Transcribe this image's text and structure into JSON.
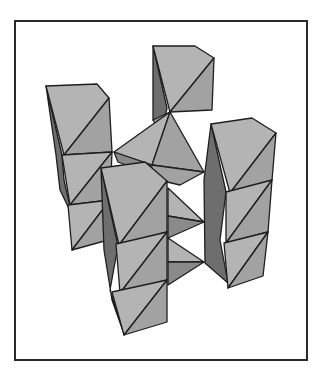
{
  "figure": {
    "frame": {
      "x": 14,
      "y": 20,
      "width": 290,
      "height": 337,
      "border_color": "#2a2a2a"
    },
    "colors": {
      "light": "#b4b4b4",
      "mid": "#a2a2a2",
      "dark": "#8a8a8a",
      "darker": "#6e6e6e",
      "edge": "#1e1e1e",
      "background": "#ffffff"
    },
    "polyhedra": [
      {
        "name": "back-center-octahedra-chain",
        "faces": [
          {
            "shade": "darker",
            "pts": "153,46 167,108 163,126 153,120"
          },
          {
            "shade": "light",
            "pts": "153,46 195,46 214,58 170,112"
          },
          {
            "shade": "mid",
            "pts": "214,58 212,110 170,112"
          },
          {
            "shade": "mid",
            "pts": "153,120 170,112 165,140"
          }
        ]
      },
      {
        "name": "left-octahedra-chain",
        "faces": [
          {
            "shade": "darker",
            "pts": "46,86 62,155 64,180 72,215 60,190 56,155"
          },
          {
            "shade": "light",
            "pts": "46,86 97,84 109,98 64,155"
          },
          {
            "shade": "mid",
            "pts": "109,98 112,152 64,155"
          },
          {
            "shade": "light",
            "pts": "62,155 112,152 70,205"
          },
          {
            "shade": "mid",
            "pts": "112,152 110,200 70,205"
          },
          {
            "shade": "light",
            "pts": "68,205 110,200 72,250"
          },
          {
            "shade": "mid",
            "pts": "110,200 108,240 72,250"
          }
        ]
      },
      {
        "name": "central-tetrahedra-stack",
        "faces": [
          {
            "shade": "light",
            "pts": "114,152 170,112 152,165"
          },
          {
            "shade": "mid",
            "pts": "170,112 204,172 152,165"
          },
          {
            "shade": "dark",
            "pts": "114,152 152,165 140,170 118,162"
          },
          {
            "shade": "mid",
            "pts": "152,165 204,172 180,185 150,178"
          },
          {
            "shade": "light",
            "pts": "168,188 204,222 168,216"
          },
          {
            "shade": "dark",
            "pts": "168,216 204,222 168,238"
          },
          {
            "shade": "light",
            "pts": "168,238 204,262 168,262"
          },
          {
            "shade": "dark",
            "pts": "168,262 204,262 168,285"
          }
        ]
      },
      {
        "name": "right-octahedra-chain",
        "faces": [
          {
            "shade": "darker",
            "pts": "211,124 226,192 220,240 228,283 205,263 204,180"
          },
          {
            "shade": "light",
            "pts": "211,124 252,118 276,133 230,193"
          },
          {
            "shade": "mid",
            "pts": "276,133 272,180 230,193"
          },
          {
            "shade": "light",
            "pts": "226,192 272,180 226,243"
          },
          {
            "shade": "mid",
            "pts": "272,180 268,232 226,243"
          },
          {
            "shade": "light",
            "pts": "224,243 268,232 228,288"
          },
          {
            "shade": "mid",
            "pts": "268,232 263,276 228,288"
          }
        ]
      },
      {
        "name": "front-center-octahedra-chain",
        "faces": [
          {
            "shade": "darker",
            "pts": "101,168 118,246 110,290 124,334 112,300 104,250"
          },
          {
            "shade": "light",
            "pts": "101,168 145,162 167,181 119,245"
          },
          {
            "shade": "mid",
            "pts": "167,181 167,232 119,245"
          },
          {
            "shade": "light",
            "pts": "116,244 167,232 120,293"
          },
          {
            "shade": "mid",
            "pts": "167,232 167,280 120,293"
          },
          {
            "shade": "light",
            "pts": "112,292 167,280 124,335"
          },
          {
            "shade": "mid",
            "pts": "167,280 167,322 124,335"
          }
        ]
      }
    ]
  }
}
